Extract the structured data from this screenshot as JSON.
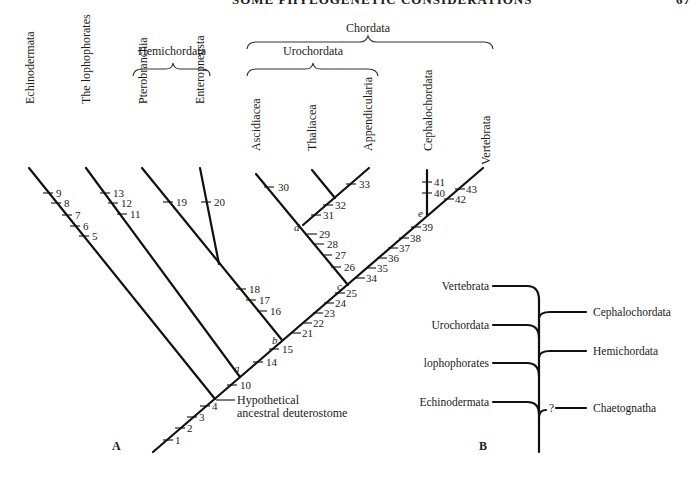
{
  "page": {
    "running_header": "SOME PHYLOGENETIC CONSIDERATIONS",
    "page_number": "67"
  },
  "panel_a": {
    "letter": "A",
    "groups": {
      "hemichordata": "Hemichordata",
      "urochordata": "Urochordata",
      "chordata": "Chordata"
    },
    "taxa": {
      "echinodermata": "Echinodermata",
      "lophophorates": "The lophophorates",
      "pterobranchia": "Pterobranchia",
      "enteropneusta": "Enteropneusta",
      "ascidiacea": "Ascidiacea",
      "thaliacea": "Thaliacea",
      "appendicularia": "Appendicularia",
      "cephalochordata": "Cephalochordata",
      "vertebrata": "Vertebrata"
    },
    "ancestor_label_line1": "Hypothetical",
    "ancestor_label_line2": "ancestral deuterostome",
    "nodes": {
      "a": "a",
      "b": "b",
      "c": "c",
      "d": "d",
      "e": "e"
    },
    "characters": {
      "c1": "1",
      "c2": "2",
      "c3": "3",
      "c4": "4",
      "c5": "5",
      "c6": "6",
      "c7": "7",
      "c8": "8",
      "c9": "9",
      "c10": "10",
      "c11": "11",
      "c12": "12",
      "c13": "13",
      "c14": "14",
      "c15": "15",
      "c16": "16",
      "c17": "17",
      "c18": "18",
      "c19": "19",
      "c20": "20",
      "c21": "21",
      "c22": "22",
      "c23": "23",
      "c24": "24",
      "c25": "25",
      "c26": "26",
      "c27": "27",
      "c28": "28",
      "c29": "29",
      "c30": "30",
      "c31": "31",
      "c32": "32",
      "c33": "33",
      "c34": "34",
      "c35": "35",
      "c36": "36",
      "c37": "37",
      "c38": "38",
      "c39": "39",
      "c40": "40",
      "c41": "41",
      "c42": "42",
      "c43": "43"
    }
  },
  "panel_b": {
    "letter": "B",
    "left_taxa": {
      "vertebrata": "Vertebrata",
      "urochordata": "Urochordata",
      "lophophorates": "lophophorates",
      "echinodermata": "Echinodermata"
    },
    "right_taxa": {
      "cephalochordata": "Cephalochordata",
      "hemichordata": "Hemichordata",
      "chaetognatha": "Chaetognatha"
    },
    "uncertain_mark": "?"
  }
}
